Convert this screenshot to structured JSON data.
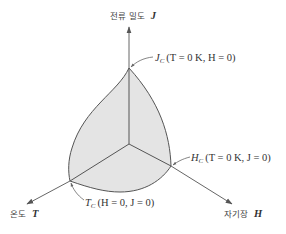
{
  "diagram": {
    "type": "superconductor-critical-surface-3d",
    "colors": {
      "surface_fill": "#e4e4e4",
      "outline": "#555555",
      "axis": "#666666",
      "text": "#333333"
    },
    "axes": {
      "j": {
        "korean": "전류 밀도",
        "symbol": "J"
      },
      "t": {
        "korean": "온도",
        "symbol": "T"
      },
      "h": {
        "korean": "자기장",
        "symbol": "H"
      }
    },
    "points": {
      "jc": {
        "symbol": "J",
        "subscript": "C",
        "condition": "(T = 0 K, H = 0)"
      },
      "hc": {
        "symbol": "H",
        "subscript": "C",
        "condition": "(T = 0 K, J = 0)"
      },
      "tc": {
        "symbol": "T",
        "subscript": "C",
        "condition": "(H = 0, J = 0)"
      }
    }
  }
}
